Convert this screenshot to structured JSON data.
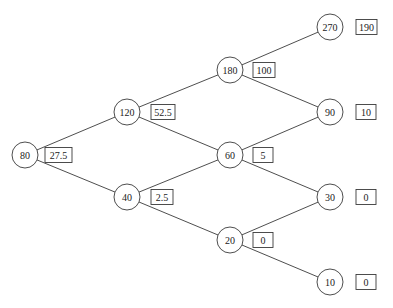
{
  "diagram": {
    "type": "binomial-tree",
    "node_radius": 13,
    "nodes": [
      {
        "id": "n0",
        "label": "80",
        "value": "27.5",
        "x": 25,
        "y": 155,
        "box_x": 45,
        "box_w": 27
      },
      {
        "id": "n1u",
        "label": "120",
        "value": "52.5",
        "x": 127,
        "y": 112,
        "box_x": 151,
        "box_w": 24
      },
      {
        "id": "n1d",
        "label": "40",
        "value": "2.5",
        "x": 127,
        "y": 197,
        "box_x": 151,
        "box_w": 22
      },
      {
        "id": "n2u",
        "label": "180",
        "value": "100",
        "x": 230,
        "y": 70,
        "box_x": 253,
        "box_w": 22
      },
      {
        "id": "n2m",
        "label": "60",
        "value": "5",
        "x": 230,
        "y": 155,
        "box_x": 253,
        "box_w": 20
      },
      {
        "id": "n2d",
        "label": "20",
        "value": "0",
        "x": 230,
        "y": 240,
        "box_x": 253,
        "box_w": 20
      },
      {
        "id": "n3a",
        "label": "270",
        "value": "190",
        "x": 330,
        "y": 27,
        "box_x": 356,
        "box_w": 21
      },
      {
        "id": "n3b",
        "label": "90",
        "value": "10",
        "x": 330,
        "y": 112,
        "box_x": 356,
        "box_w": 20
      },
      {
        "id": "n3c",
        "label": "30",
        "value": "0",
        "x": 330,
        "y": 197,
        "box_x": 356,
        "box_w": 20
      },
      {
        "id": "n3d",
        "label": "10",
        "value": "0",
        "x": 330,
        "y": 282,
        "box_x": 356,
        "box_w": 20
      }
    ],
    "edges": [
      [
        "n0",
        "n1u"
      ],
      [
        "n0",
        "n1d"
      ],
      [
        "n1u",
        "n2u"
      ],
      [
        "n1u",
        "n2m"
      ],
      [
        "n1d",
        "n2m"
      ],
      [
        "n1d",
        "n2d"
      ],
      [
        "n2u",
        "n3a"
      ],
      [
        "n2u",
        "n3b"
      ],
      [
        "n2m",
        "n3b"
      ],
      [
        "n2m",
        "n3c"
      ],
      [
        "n2d",
        "n3c"
      ],
      [
        "n2d",
        "n3d"
      ]
    ],
    "colors": {
      "stroke": "#3a3a3a",
      "text": "#222222",
      "background": "#ffffff"
    }
  }
}
